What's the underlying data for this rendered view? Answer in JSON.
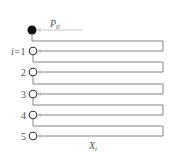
{
  "diagram": {
    "source_node": {
      "label_main": "P",
      "label_sub": "0",
      "style": "filled"
    },
    "index_prefix": "i=",
    "nodes": [
      {
        "index": "1",
        "y": 51
      },
      {
        "index": "2",
        "y": 72
      },
      {
        "index": "3",
        "y": 94
      },
      {
        "index": "4",
        "y": 115
      },
      {
        "index": "5",
        "y": 136
      }
    ],
    "bottom_label": {
      "main": "X",
      "sub": "i"
    },
    "colors": {
      "line": "#555555",
      "arrow": "#b0b0b0",
      "node_stroke": "#333333",
      "node_fill_source": "#111111"
    }
  }
}
